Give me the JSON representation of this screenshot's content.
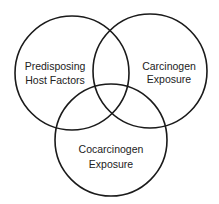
{
  "diagram": {
    "type": "venn",
    "colors": {
      "stroke": "#1a1a1a",
      "text": "#222222",
      "background": "#ffffff"
    },
    "sets": [
      {
        "id": "host",
        "line1": "Predisposing",
        "line2": "Host Factors",
        "cx": 72,
        "cy": 73,
        "r": 57,
        "lx": 55,
        "ly1": 67,
        "ly2": 81
      },
      {
        "id": "carcinogen",
        "line1": "Carcinogen",
        "line2": "Exposure",
        "cx": 150,
        "cy": 71,
        "r": 57,
        "lx": 169,
        "ly1": 67,
        "ly2": 80
      },
      {
        "id": "cocarcinogen",
        "line1": "Cocarcinogen",
        "line2": "Exposure",
        "cx": 111,
        "cy": 140,
        "r": 56,
        "lx": 111,
        "ly1": 150,
        "ly2": 165
      }
    ]
  }
}
